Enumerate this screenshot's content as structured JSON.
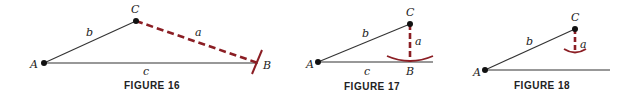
{
  "colors": {
    "line": "#333333",
    "accent": "#8b1e24",
    "point": "#111111"
  },
  "figures": [
    {
      "caption": "FIGURE 16",
      "labels": {
        "A": "A",
        "B": "B",
        "C": "C",
        "a": "a",
        "b": "b",
        "c": "c"
      }
    },
    {
      "caption": "FIGURE 17",
      "labels": {
        "A": "A",
        "B": "B",
        "C": "C",
        "a": "a",
        "b": "b",
        "c": "c"
      }
    },
    {
      "caption": "FIGURE 18",
      "labels": {
        "A": "A",
        "C": "C",
        "a": "a",
        "b": "b"
      }
    }
  ]
}
